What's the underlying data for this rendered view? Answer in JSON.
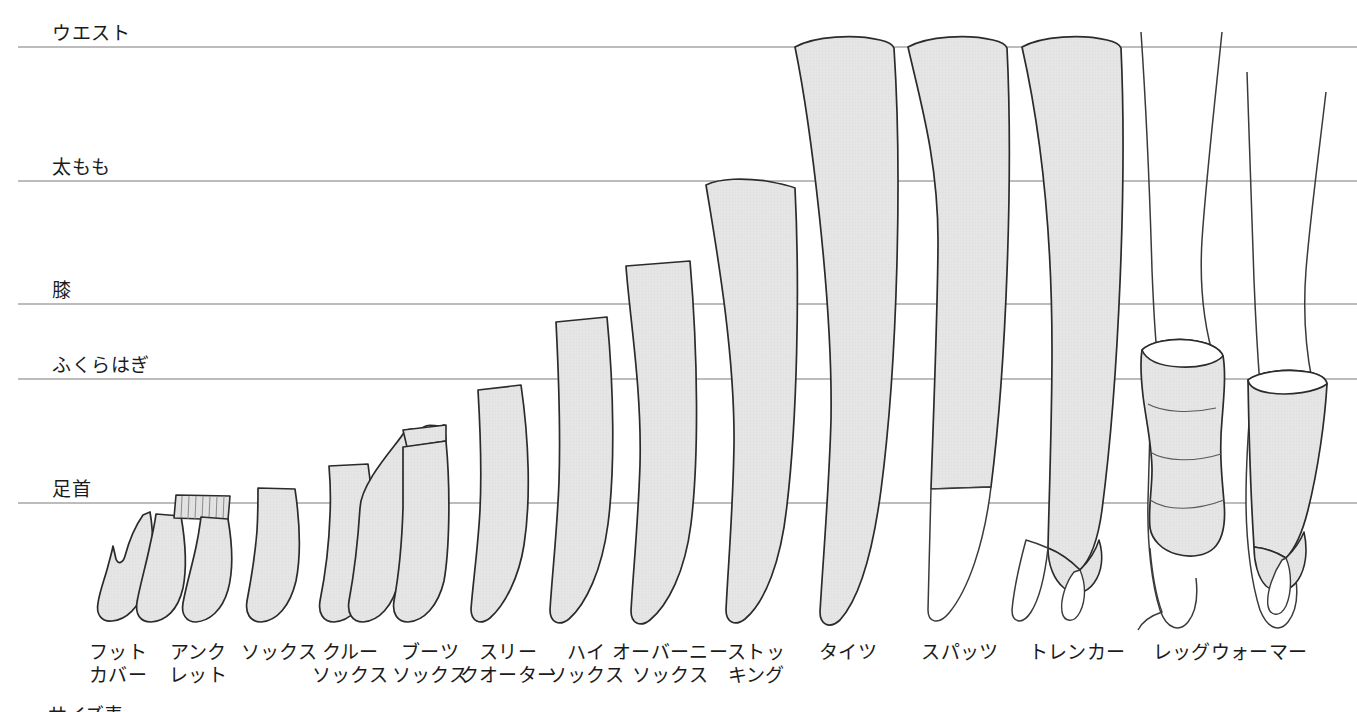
{
  "figure": {
    "kind": "legwear-length-comparison-diagram",
    "background_color": "#ffffff",
    "fill_color": "#e3e3e3",
    "outline_color": "#2b2b2b",
    "line_color": "#6f6f6f",
    "skin_outline_color": "#3a3a3a"
  },
  "reference_lines": [
    {
      "id": "waist",
      "label": "ウエスト",
      "y": 47,
      "label_x": 52,
      "label_y": 24,
      "x_end": 1357
    },
    {
      "id": "thigh",
      "label": "太もも",
      "y": 181,
      "label_x": 52,
      "label_y": 158,
      "x_end": 1357
    },
    {
      "id": "knee",
      "label": "膝",
      "y": 304,
      "label_x": 52,
      "label_y": 281,
      "x_end": 1357
    },
    {
      "id": "calf",
      "label": "ふくらはぎ",
      "y": 379,
      "label_x": 52,
      "label_y": 356,
      "x_end": 1357
    },
    {
      "id": "ankle",
      "label": "足首",
      "y": 503,
      "label_x": 52,
      "label_y": 480,
      "x_end": 1357
    }
  ],
  "items": [
    {
      "id": "foot-cover",
      "line1": "フット",
      "line2": "カバー",
      "cx": 133,
      "top_y": 515,
      "top_ref": "below-ankle"
    },
    {
      "id": "anklet",
      "line1": "アンク",
      "line2": "レット",
      "cx": 200,
      "top_y": 495,
      "top_ref": "ankle"
    },
    {
      "id": "socks",
      "line1": "ソックス",
      "line2": "",
      "cx": 277,
      "top_y": 488,
      "top_ref": "ankle"
    },
    {
      "id": "crew-socks",
      "line1": "クルー",
      "line2": "ソックス",
      "cx": 348,
      "top_y": 465,
      "top_ref": "above-ankle"
    },
    {
      "id": "boots-socks",
      "line1": "ブーツ",
      "line2": "ソックス",
      "cx": 424,
      "top_y": 428,
      "top_ref": "above-ankle"
    },
    {
      "id": "three-quarter",
      "line1": "スリー",
      "line2": "クオーター",
      "cx": 503,
      "top_y": 385,
      "top_ref": "calf"
    },
    {
      "id": "high-socks",
      "line1": "ハイ",
      "line2": "ソックス",
      "cx": 583,
      "top_y": 318,
      "top_ref": "between-knee-calf"
    },
    {
      "id": "over-knee",
      "line1": "オーバーニー",
      "line2": "ソックス",
      "cx": 663,
      "top_y": 262,
      "top_ref": "above-knee"
    },
    {
      "id": "stocking",
      "line1": "ストッ",
      "line2": "キング",
      "cx": 746,
      "top_y": 179,
      "top_ref": "thigh"
    },
    {
      "id": "tights",
      "line1": "タイツ",
      "line2": "",
      "cx": 843,
      "top_y": 40,
      "top_ref": "waist"
    },
    {
      "id": "spats",
      "line1": "スパッツ",
      "line2": "",
      "cx": 955,
      "top_y": 40,
      "top_ref": "waist"
    },
    {
      "id": "trenker",
      "line1": "トレンカー",
      "line2": "",
      "cx": 1070,
      "top_y": 40,
      "top_ref": "waist"
    },
    {
      "id": "leg-warmer-a",
      "line1": "レッグウォーマー",
      "line2": "",
      "cx": 1222,
      "top_y": 345,
      "top_ref": "below-calf"
    },
    {
      "id": "leg-warmer-b",
      "line1": "",
      "line2": "",
      "cx": 1300,
      "top_y": 350,
      "top_ref": "below-calf"
    }
  ],
  "cut_off_text": {
    "value": "サイズ表",
    "x": 48,
    "y": 700
  }
}
